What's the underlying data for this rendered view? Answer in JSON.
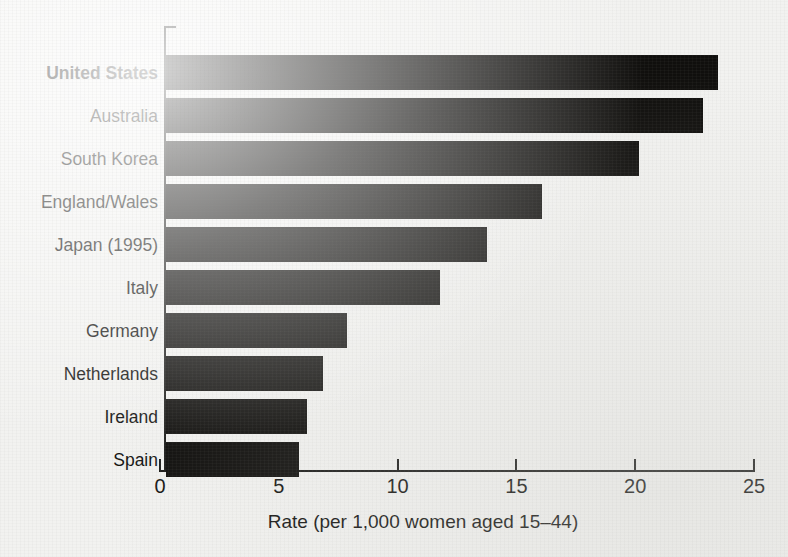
{
  "chart_data": {
    "type": "bar",
    "orientation": "horizontal",
    "title": "",
    "subtitle": "",
    "xlabel": "Rate (per 1,000 women aged 15–44)",
    "ylabel": "",
    "categories": [
      "United States",
      "Australia",
      "South Korea",
      "England/Wales",
      "Japan (1995)",
      "Italy",
      "Germany",
      "Netherlands",
      "Ireland",
      "Spain"
    ],
    "values": [
      23.3,
      22.7,
      20.0,
      15.9,
      13.6,
      11.6,
      7.7,
      6.7,
      6.0,
      5.7
    ],
    "highlighted_category": "United States",
    "xlim": [
      0,
      25
    ],
    "xticks": [
      0,
      5,
      10,
      15,
      20,
      25
    ],
    "xtick_labels": [
      "0",
      "5",
      "10",
      "15",
      "20",
      "25"
    ],
    "grid": false,
    "legend": null,
    "bar_color": "#100f0d",
    "background_color": "#f2f2f0",
    "axis_color": "#1a1a18"
  },
  "axis": {
    "x_title": "Rate (per 1,000 women aged 15–44)"
  }
}
